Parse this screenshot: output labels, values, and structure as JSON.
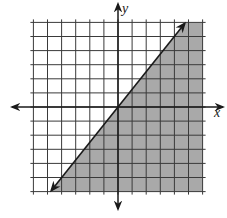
{
  "chart_data": {
    "type": "area",
    "title": "",
    "xlabel": "x",
    "ylabel": "y",
    "xlim": [
      -6,
      6
    ],
    "ylim": [
      -6,
      6
    ],
    "grid": true,
    "grid_step": 1,
    "tick_labels": false,
    "boundary_line": {
      "equation": "y = (5/4)x",
      "slope": 1.25,
      "intercept": 0,
      "style": "solid",
      "points": [
        [
          -4.8,
          -6
        ],
        [
          -4,
          -5
        ],
        [
          0,
          0
        ],
        [
          4,
          5
        ],
        [
          4.8,
          6
        ]
      ]
    },
    "inequality": "y <= (5/4)x",
    "shaded_region": "below-right of line",
    "colors": {
      "shade": "#a9a9a9",
      "grid": "#3a3a3a",
      "axis": "#1a1a1a",
      "background": "#ffffff"
    }
  },
  "labels": {
    "x_axis": "x",
    "y_axis": "y"
  }
}
